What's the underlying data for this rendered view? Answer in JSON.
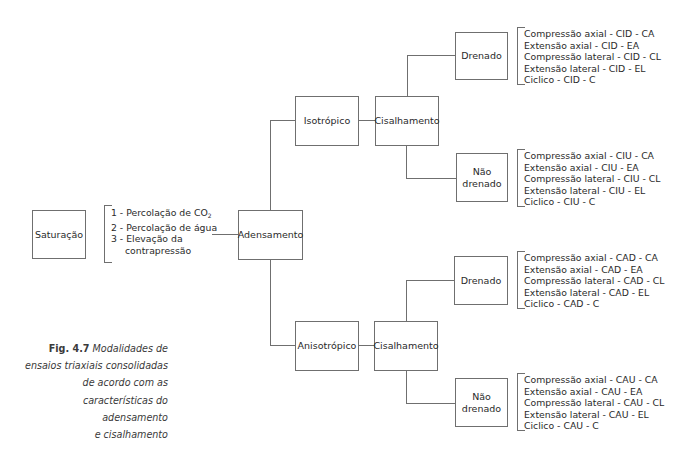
{
  "diagram": {
    "saturacao": {
      "label": "Saturação"
    },
    "saturation_steps": {
      "items": [
        "1 - Percolação de CO",
        "2 - Percolação de água",
        "3 - Elevação da",
        "contrapressão"
      ],
      "co2_subscript": "2"
    },
    "adensamento": {
      "label": "Adensamento"
    },
    "branches": [
      {
        "type": {
          "label": "Isotrópico"
        },
        "shear": {
          "label": "Cisalhamento"
        },
        "drained": {
          "label": "Drenado",
          "tests": [
            "Compressão axial - CID - CA",
            "Extensão axial - CID - EA",
            "Compressão lateral - CID - CL",
            "Extensão lateral - CID - EL",
            "Ciclico - CID - C"
          ]
        },
        "undrained": {
          "label_line1": "Não",
          "label_line2": "drenado",
          "tests": [
            "Compressão axial - CIU - CA",
            "Extensão axial - CIU - EA",
            "Compressão lateral - CIU - CL",
            "Extensão lateral - CIU - EL",
            "Ciclico - CIU - C"
          ]
        }
      },
      {
        "type": {
          "label": "Anisotrópico"
        },
        "shear": {
          "label": "Cisalhamento"
        },
        "drained": {
          "label": "Drenado",
          "tests": [
            "Compressão axial - CAD - CA",
            "Extensão axial - CAD - EA",
            "Compressão lateral - CAD - CL",
            "Extensão lateral - CAD - EL",
            "Ciclico - CAD - C"
          ]
        },
        "undrained": {
          "label_line1": "Não",
          "label_line2": "drenado",
          "tests": [
            "Compressão axial - CAU - CA",
            "Extensão axial - CAU - EA",
            "Compressão lateral - CAU - CL",
            "Extensão lateral - CAU - EL",
            "Ciclico - CAU - C"
          ]
        }
      }
    ]
  },
  "caption": {
    "figure_label": "Fig. 4.7",
    "lines": [
      "Modalidades de",
      "ensaios triaxiais consolidadas",
      "de acordo com as",
      "características do adensamento",
      "e cisalhamento"
    ]
  },
  "colors": {
    "line": "#6f6f6f",
    "text": "#2a2a2a"
  }
}
